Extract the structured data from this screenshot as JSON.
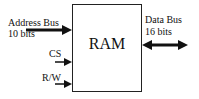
{
  "diagram": {
    "component": "RAM",
    "inputs": [
      {
        "label": "Address Bus",
        "sublabel": "10 bits"
      },
      {
        "label": "CS"
      },
      {
        "label": "R/W"
      }
    ],
    "outputs": [
      {
        "label": "Data  Bus",
        "sublabel": "16 bits",
        "bidirectional": true
      }
    ]
  }
}
